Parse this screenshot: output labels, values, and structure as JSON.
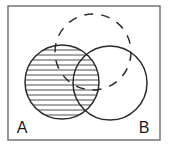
{
  "figure": {
    "kind": "venn-diagram",
    "title": "",
    "background_color": "#ffffff",
    "stroke_color": "#2b2b2b",
    "hatch_color": "#3a3a3a"
  },
  "frame": {
    "name": "diagram-border",
    "x": 8,
    "y": 6,
    "width": 152,
    "height": 134,
    "stroke_color": "#6b6b6b",
    "stroke_width": 1.4
  },
  "sets": [
    {
      "id": "A",
      "label": "A",
      "shape": "circle",
      "style": "solid",
      "cx": 62,
      "cy": 82,
      "r": 37,
      "fill": "horizontal-hatch",
      "label_x": 22,
      "label_y": 133
    },
    {
      "id": "B",
      "label": "B",
      "shape": "circle",
      "style": "solid",
      "cx": 110,
      "cy": 83,
      "r": 37,
      "fill": "none",
      "label_x": 144,
      "label_y": 133
    },
    {
      "id": "C",
      "label": "",
      "shape": "circle",
      "style": "dashed",
      "cx": 93,
      "cy": 52,
      "r": 38,
      "fill": "none",
      "dash_pattern": "9 8"
    }
  ],
  "hatching": {
    "orientation": "horizontal",
    "spacing_px": 5,
    "line_width": 0.9,
    "region": "set-A-including-overlap",
    "line_count": 14
  },
  "labels": {
    "set_a": "A",
    "set_b": "B"
  }
}
